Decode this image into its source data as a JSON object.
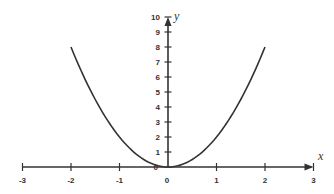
{
  "chart_data": {
    "type": "line",
    "title": "",
    "xlabel": "x",
    "ylabel": "y",
    "xlim": [
      -3,
      3
    ],
    "ylim": [
      0,
      10
    ],
    "x_ticks": [
      -3,
      -2,
      -1,
      0,
      1,
      2,
      3
    ],
    "y_ticks": [
      1,
      2,
      3,
      4,
      5,
      6,
      7,
      8,
      9,
      10
    ],
    "grid": false,
    "legend": null,
    "series": [
      {
        "name": "y = 2x^2",
        "x": [
          -2,
          -1.5,
          -1,
          -0.5,
          0,
          0.5,
          1,
          1.5,
          2
        ],
        "y": [
          8,
          4.5,
          2,
          0.5,
          0,
          0.5,
          2,
          4.5,
          8
        ]
      }
    ]
  },
  "colors": {
    "axis": "#333333",
    "curve": "#333333",
    "background": "#ffffff"
  }
}
